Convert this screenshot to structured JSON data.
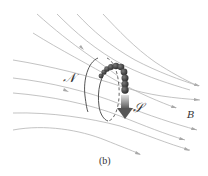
{
  "figure": {
    "caption": "(b)",
    "labels": {
      "north": "𝒩",
      "south": "𝒮",
      "field": "B"
    },
    "colors": {
      "field_line": "#b4b4b4",
      "loop": "#555555",
      "sphere": "#3a3a3a",
      "arrow_top": "#d0d0d0",
      "arrow_bottom": "#5a5a5a",
      "text": "#333333"
    },
    "elements": {
      "field_lines_count": 10,
      "sphere_count": 10,
      "description": "Magnetic field lines B passing through a current loop with north pole N and south pole S; a chain of spheres traces the loop with an arrow indicating direction."
    }
  }
}
